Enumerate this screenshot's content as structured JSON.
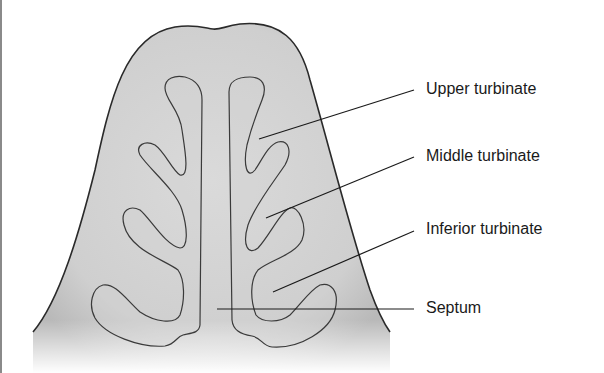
{
  "diagram": {
    "type": "anatomical cross-section",
    "colors": {
      "tissue_fill": "#d4d4d4",
      "outline": "#2a2a2a",
      "leader_line": "#1a1a1a",
      "text": "#1a1a1a",
      "left_border": "#8a8a8a"
    },
    "labels": [
      {
        "id": "upper",
        "text": "Upper turbinate"
      },
      {
        "id": "middle",
        "text": "Middle turbinate"
      },
      {
        "id": "inferior",
        "text": "Inferior turbinate"
      },
      {
        "id": "septum",
        "text": "Septum"
      }
    ]
  }
}
